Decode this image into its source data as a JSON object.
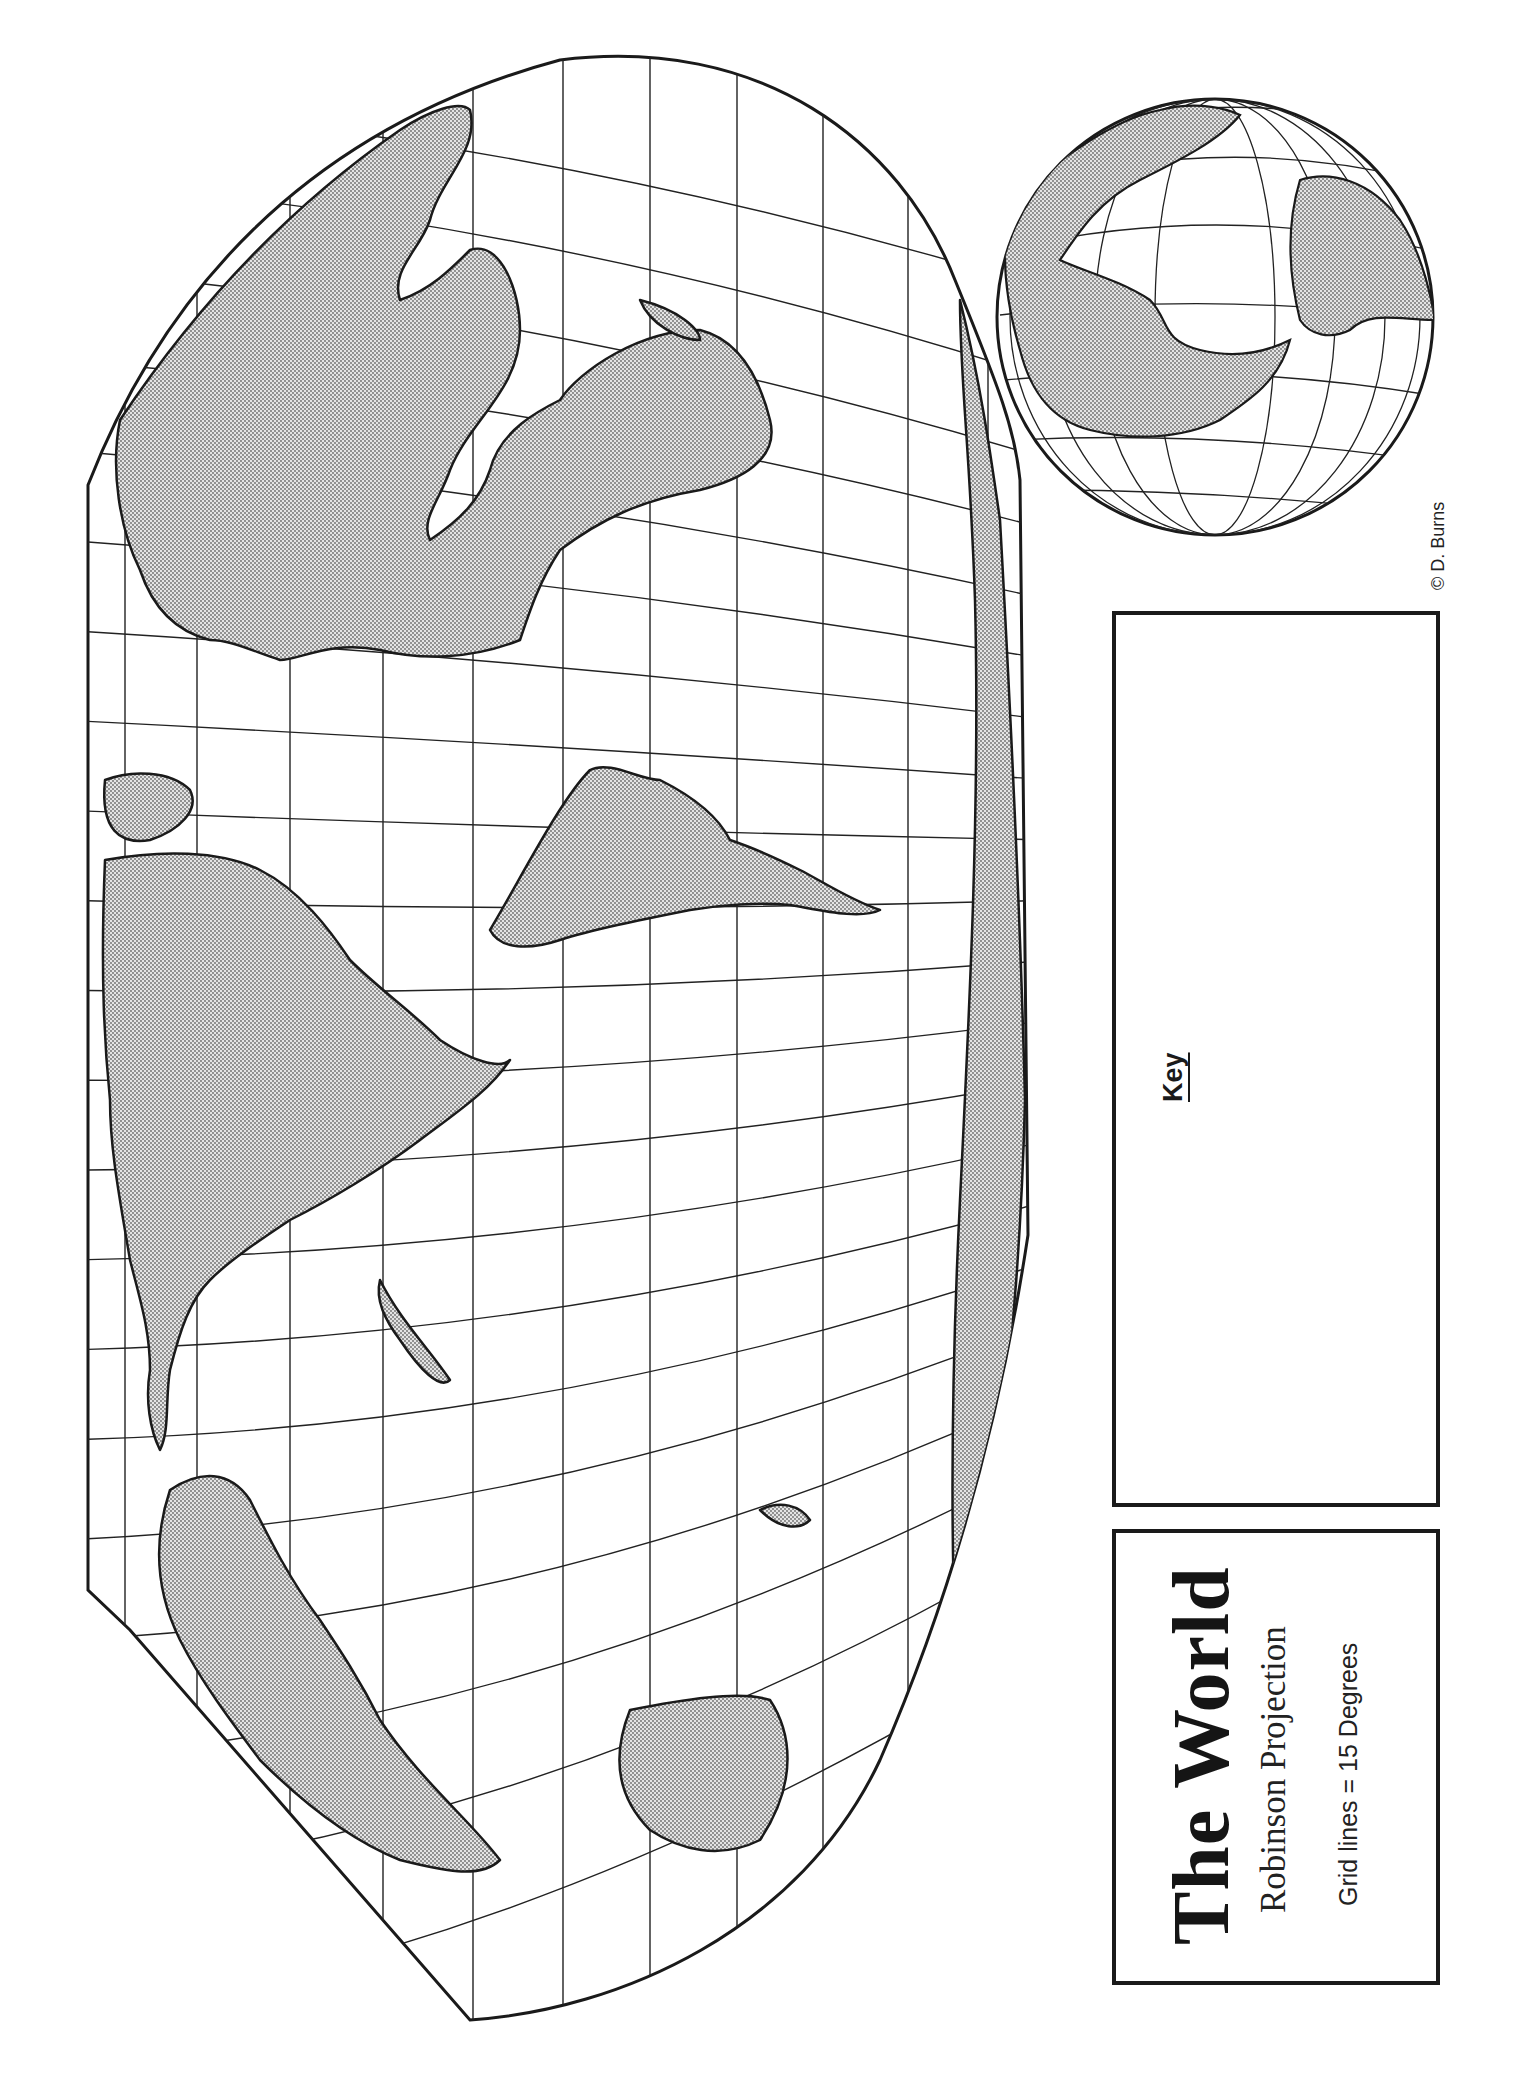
{
  "title": {
    "main": "The World",
    "projection": "Robinson Projection",
    "grid_note": "Grid lines  =  15 Degrees"
  },
  "key": {
    "label": "Key"
  },
  "credit": "© D. Burns",
  "map": {
    "projection": "Robinson",
    "orientation": "rotated 90° counter-clockwise (north to the left)",
    "grid_interval_degrees": 15,
    "land_fill": "stippled gray",
    "land_color": "#c8c8c8",
    "outline_color": "#1a1a1a",
    "ocean_color": "#ffffff"
  },
  "inset_globe": {
    "type": "orthographic hemisphere view",
    "grid": "meridians and parallels"
  }
}
